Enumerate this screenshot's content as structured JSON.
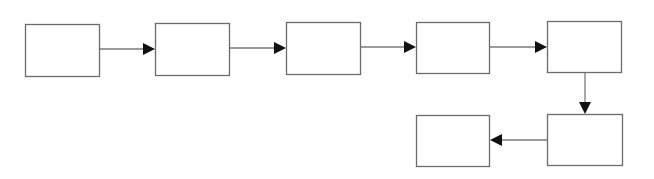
{
  "diagram": {
    "type": "flowchart",
    "colors": {
      "background": "#ffffff",
      "node_border": "#6b6b6b",
      "edge_line": "#7a7a7a",
      "arrowhead": "#111111"
    },
    "nodes": [
      {
        "id": "n1",
        "label": "",
        "x": 25,
        "y": 24,
        "w": 74,
        "h": 52
      },
      {
        "id": "n2",
        "label": "",
        "x": 155,
        "y": 23,
        "w": 74,
        "h": 52
      },
      {
        "id": "n3",
        "label": "",
        "x": 286,
        "y": 22,
        "w": 74,
        "h": 52
      },
      {
        "id": "n4",
        "label": "",
        "x": 416,
        "y": 22,
        "w": 73,
        "h": 51
      },
      {
        "id": "n5",
        "label": "",
        "x": 547,
        "y": 21,
        "w": 74,
        "h": 51
      },
      {
        "id": "n6",
        "label": "",
        "x": 547,
        "y": 114,
        "w": 75,
        "h": 51
      },
      {
        "id": "n7",
        "label": "",
        "x": 416,
        "y": 115,
        "w": 73,
        "h": 51
      }
    ],
    "edges": [
      {
        "from": "n1",
        "to": "n2",
        "direction": "right",
        "x1": 99,
        "y1": 49,
        "x2": 155,
        "y2": 49
      },
      {
        "from": "n2",
        "to": "n3",
        "direction": "right",
        "x1": 229,
        "y1": 48,
        "x2": 286,
        "y2": 48
      },
      {
        "from": "n3",
        "to": "n4",
        "direction": "right",
        "x1": 360,
        "y1": 47,
        "x2": 416,
        "y2": 47
      },
      {
        "from": "n4",
        "to": "n5",
        "direction": "right",
        "x1": 489,
        "y1": 47,
        "x2": 547,
        "y2": 47
      },
      {
        "from": "n5",
        "to": "n6",
        "direction": "down",
        "x1": 585,
        "y1": 72,
        "x2": 585,
        "y2": 114
      },
      {
        "from": "n6",
        "to": "n7",
        "direction": "left",
        "x1": 547,
        "y1": 140,
        "x2": 490,
        "y2": 140
      }
    ],
    "arrowhead_size": 12
  }
}
